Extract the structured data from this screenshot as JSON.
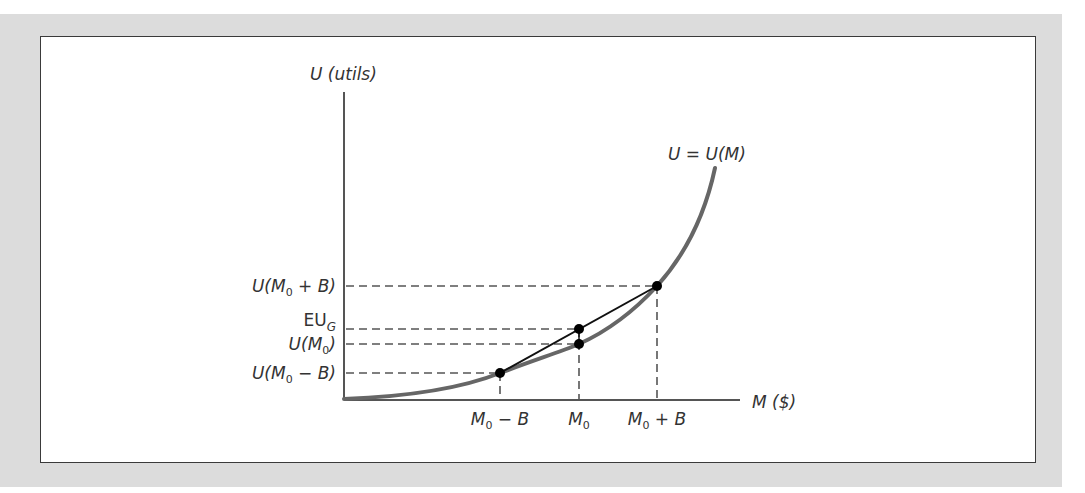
{
  "figure": {
    "y_axis_label": "U (utils)",
    "x_axis_label": "M ($)",
    "curve_label": "U = U(M)",
    "y_ticks": [
      {
        "label_main": "U(M",
        "label_sub": "0",
        "label_tail": " + B)",
        "key": "U(M0 + B)"
      },
      {
        "label_main": "EU",
        "label_sub": "G",
        "label_tail": "",
        "key": "EU_G"
      },
      {
        "label_main": "U(M",
        "label_sub": "0",
        "label_tail": ")",
        "key": "U(M0)"
      },
      {
        "label_main": "U(M",
        "label_sub": "0",
        "label_tail": " − B)",
        "key": "U(M0 − B)"
      }
    ],
    "x_ticks": [
      {
        "label_main": "M",
        "label_sub": "0",
        "label_tail": " − B",
        "key": "M0 − B"
      },
      {
        "label_main": "M",
        "label_sub": "0",
        "label_tail": "",
        "key": "M0"
      },
      {
        "label_main": "M",
        "label_sub": "0",
        "label_tail": " + B",
        "key": "M0 + B"
      }
    ],
    "colors": {
      "background": "#dcdcdc",
      "panel": "#ffffff",
      "curve": "#666666",
      "chord": "#111111",
      "axes": "#555555",
      "dash": "#555555",
      "points": "#000000"
    }
  }
}
